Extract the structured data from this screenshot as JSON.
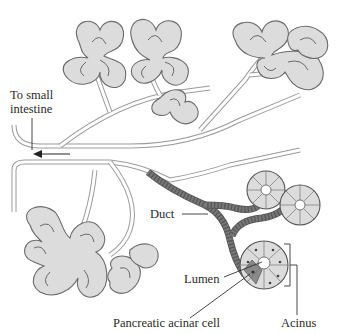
{
  "diagram": {
    "colors": {
      "background": "#ffffff",
      "lobe_fill": "#dcdcdc",
      "outline": "#6a6a6a",
      "highlighted_cell": "#8a8a8a",
      "text": "#2a2a2a"
    },
    "labels": {
      "to_small_intestine_line1": "To small",
      "to_small_intestine_line2": "intestine",
      "duct": "Duct",
      "lumen": "Lumen",
      "pancreatic_acinar_cell": "Pancreatic acinar cell",
      "acinus": "Acinus"
    },
    "arrow": {
      "direction": "left",
      "meaning": "flow toward small intestine"
    }
  }
}
